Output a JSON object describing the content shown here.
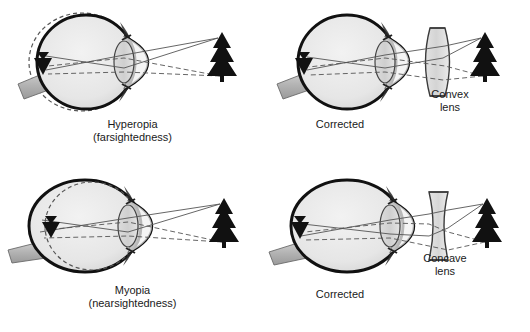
{
  "figure": {
    "background_color": "#ffffff",
    "line_color": "#1a1a1a",
    "sclera_fill": "#e8e8e8",
    "optic_nerve_fill": "#b8b8b8",
    "lens_fill": "#d8d8d8",
    "ray_color": "#555555"
  },
  "panels": [
    {
      "id": "hyperopia",
      "caption_line1": "Hyperopia",
      "caption_line2": "(farsightedness)",
      "eye_type": "shortened-eyeball",
      "normal_outline": "dashed",
      "corrective_lens": null,
      "object_name": "tree",
      "image_name": "inverted-image-arrow"
    },
    {
      "id": "corrected-hyperopia",
      "caption_line1": "Corrected",
      "caption_line2": "",
      "eye_type": "shortened-eyeball",
      "normal_outline": "none",
      "corrective_lens": "convex",
      "lens_label_line1": "Convex",
      "lens_label_line2": "lens",
      "object_name": "tree",
      "image_name": "inverted-image-arrow"
    },
    {
      "id": "myopia",
      "caption_line1": "Myopia",
      "caption_line2": "(nearsightedness)",
      "eye_type": "elongated-eyeball",
      "normal_outline": "dashed",
      "corrective_lens": null,
      "object_name": "tree",
      "image_name": "inverted-image-arrow"
    },
    {
      "id": "corrected-myopia",
      "caption_line1": "Corrected",
      "caption_line2": "",
      "eye_type": "elongated-eyeball",
      "normal_outline": "none",
      "corrective_lens": "concave",
      "lens_label_line1": "Concave",
      "lens_label_line2": "lens",
      "object_name": "tree",
      "image_name": "inverted-image-arrow"
    }
  ]
}
